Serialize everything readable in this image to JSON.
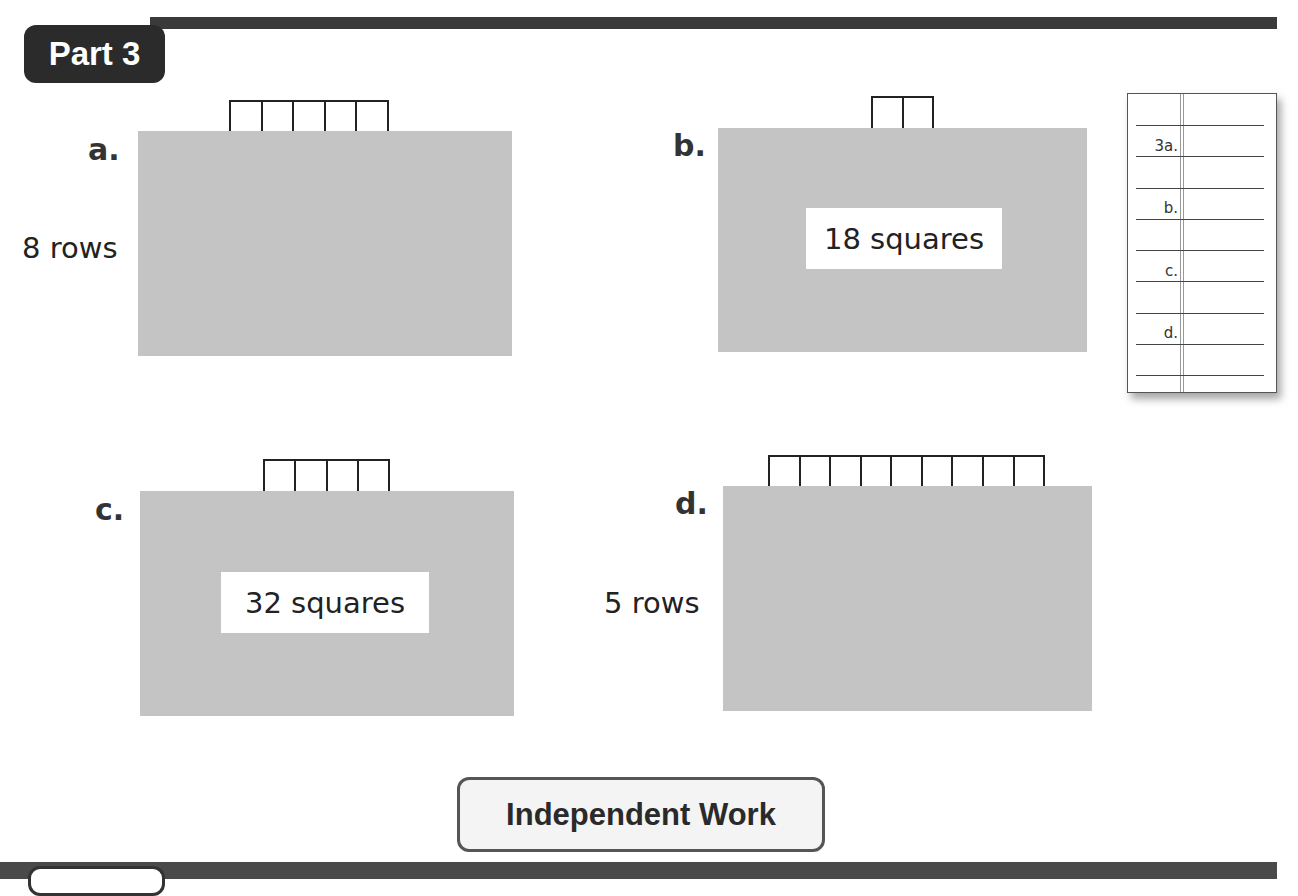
{
  "header": {
    "part_label": "Part 3"
  },
  "problems": [
    {
      "id": "a",
      "label": "a.",
      "squares_shown": 5,
      "side_label": "8 rows",
      "count_label": null
    },
    {
      "id": "b",
      "label": "b.",
      "squares_shown": 2,
      "side_label": null,
      "count_label": "18 squares"
    },
    {
      "id": "c",
      "label": "c.",
      "squares_shown": 4,
      "side_label": null,
      "count_label": "32 squares"
    },
    {
      "id": "d",
      "label": "d.",
      "squares_shown": 9,
      "side_label": "5 rows",
      "count_label": null
    }
  ],
  "answer_sheet": {
    "labels": [
      "3a.",
      "b.",
      "c.",
      "d."
    ]
  },
  "footer": {
    "section_label": "Independent Work"
  },
  "colors": {
    "bar": "#3a3a3a",
    "grid_fill": "#c4c4c4",
    "text": "#222222"
  }
}
